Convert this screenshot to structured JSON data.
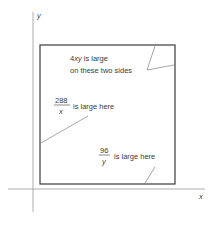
{
  "diagram": {
    "axes": {
      "x_label": "x",
      "y_label": "y"
    },
    "annotations": {
      "top_right": {
        "line1_prefix": "4",
        "line1_var": "xy",
        "line1_suffix": " is large",
        "line2": "on these two sides"
      },
      "left": {
        "numerator": "288",
        "denominator": "x",
        "text": "is large here"
      },
      "bottom": {
        "numerator": "96",
        "denominator": "y",
        "text": "is large here"
      }
    }
  }
}
